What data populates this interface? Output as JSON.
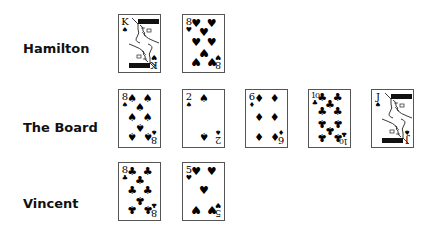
{
  "players": [
    {
      "name": "Hamilton",
      "cards": [
        {
          "rank": "K",
          "suit": "spade",
          "suit_glyph": "♠",
          "bottom_suit_glyph": "♥",
          "face": true
        },
        {
          "rank": "8",
          "suit": "heart",
          "suit_glyph": "♥",
          "face": false
        }
      ]
    },
    {
      "name": "The Board",
      "cards": [
        {
          "rank": "8",
          "suit": "spade",
          "suit_glyph": "♠",
          "face": false
        },
        {
          "rank": "2",
          "suit": "spade",
          "suit_glyph": "♠",
          "face": false
        },
        {
          "rank": "6",
          "suit": "diamond",
          "suit_glyph": "♦",
          "face": false
        },
        {
          "rank": "10",
          "suit": "club",
          "suit_glyph": "♣",
          "face": false
        },
        {
          "rank": "J",
          "suit": "spade",
          "suit_glyph": "♠",
          "face": true
        }
      ]
    },
    {
      "name": "Vincent",
      "cards": [
        {
          "rank": "8",
          "suit": "club",
          "suit_glyph": "♣",
          "face": false
        },
        {
          "rank": "5",
          "suit": "heart",
          "suit_glyph": "♥",
          "face": false
        }
      ]
    }
  ]
}
